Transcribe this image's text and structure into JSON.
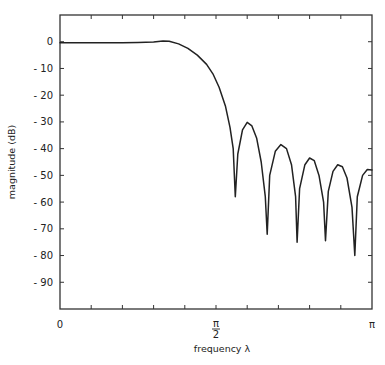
{
  "chart_data": {
    "type": "line",
    "title": "",
    "xlabel": "frequency  λ",
    "ylabel": "magnitude  (dB)",
    "xlim": [
      0,
      1
    ],
    "x_unit": "π",
    "ylim": [
      -100,
      10
    ],
    "grid": false,
    "legend": null,
    "x_ticks": [
      {
        "value": 0,
        "label": "0"
      },
      {
        "value": 0.5,
        "label": "π/2",
        "num": "π",
        "den": "2"
      },
      {
        "value": 1,
        "label": "π"
      }
    ],
    "x_minor_ticks": [
      0.1,
      0.2,
      0.3,
      0.4,
      0.6,
      0.7,
      0.8,
      0.9
    ],
    "y_ticks": [
      {
        "value": 0,
        "label": "0"
      },
      {
        "value": -10,
        "label": "-10"
      },
      {
        "value": -20,
        "label": "-20"
      },
      {
        "value": -30,
        "label": "-30"
      },
      {
        "value": -40,
        "label": "-40"
      },
      {
        "value": -50,
        "label": "-50"
      },
      {
        "value": -60,
        "label": "-60"
      },
      {
        "value": -70,
        "label": "-70"
      },
      {
        "value": -80,
        "label": "-80"
      },
      {
        "value": -90,
        "label": "-90"
      }
    ],
    "series": [
      {
        "name": "magnitude response",
        "color": "#222222",
        "x": [
          0.0,
          0.05,
          0.1,
          0.15,
          0.2,
          0.25,
          0.3,
          0.33,
          0.35,
          0.38,
          0.41,
          0.44,
          0.47,
          0.49,
          0.51,
          0.53,
          0.545,
          0.555,
          0.562,
          0.57,
          0.585,
          0.6,
          0.615,
          0.63,
          0.645,
          0.658,
          0.664,
          0.672,
          0.69,
          0.708,
          0.726,
          0.742,
          0.755,
          0.76,
          0.768,
          0.785,
          0.8,
          0.815,
          0.83,
          0.845,
          0.851,
          0.86,
          0.875,
          0.89,
          0.905,
          0.92,
          0.936,
          0.945,
          0.953,
          0.97,
          0.985,
          1.0
        ],
        "y": [
          -0.4,
          -0.4,
          -0.4,
          -0.4,
          -0.35,
          -0.3,
          -0.1,
          0.3,
          0.2,
          -0.8,
          -2.5,
          -5,
          -8.5,
          -12,
          -17,
          -24,
          -32,
          -40,
          -58,
          -42,
          -33,
          -30.2,
          -31.5,
          -36,
          -45,
          -58,
          -72,
          -50,
          -41,
          -38.5,
          -40,
          -46,
          -58,
          -75,
          -55,
          -46,
          -43.5,
          -44.5,
          -50,
          -60,
          -74.5,
          -56,
          -48.5,
          -46,
          -46.8,
          -51,
          -62,
          -80,
          -58,
          -50,
          -47.8,
          -48
        ]
      }
    ],
    "annotations": []
  },
  "labels": {
    "x_axis": "frequency  λ",
    "y_axis": "magnitude  (dB)"
  }
}
